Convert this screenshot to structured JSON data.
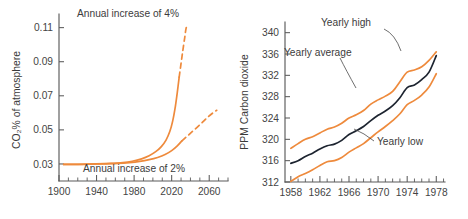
{
  "figure": {
    "background": "#ffffff",
    "orange": "#ee8A3c",
    "navy": "#1d2430",
    "axis_color": "#5a5a5a"
  },
  "left_chart": {
    "ylabel": "CO₂% of atmosphere",
    "y_ticks": [
      "0.03",
      "0.05",
      "0.07",
      "0.09",
      "0.11"
    ],
    "x_ticks": [
      "1900",
      "1940",
      "1980",
      "2020",
      "2060"
    ],
    "annotation_top": "Annual increase of 4%",
    "annotation_bottom": "Annual increase of 2%"
  },
  "right_chart": {
    "ylabel": "PPM Carbon dioxide",
    "y_ticks": [
      "312",
      "316",
      "320",
      "324",
      "328",
      "332",
      "336",
      "340"
    ],
    "x_ticks": [
      "1958",
      "1962",
      "1966",
      "1970",
      "1974",
      "1978"
    ],
    "label_high": "Yearly high",
    "label_average": "Yearly average",
    "label_low": "Yearly low"
  },
  "chart_data": [
    {
      "type": "line",
      "id": "co2-projection",
      "title": "",
      "xlabel": "",
      "ylabel": "CO2% of atmosphere",
      "xlim": [
        1900,
        2080
      ],
      "ylim": [
        0.02,
        0.118
      ],
      "grid": false,
      "legend": "annotations-inline",
      "x_ticks": [
        1900,
        1940,
        1980,
        2020,
        2060
      ],
      "y_ticks": [
        0.03,
        0.05,
        0.07,
        0.09,
        0.11
      ],
      "annotations": [
        {
          "text": "Annual increase of 4%",
          "x": 1985,
          "y": 0.115
        },
        {
          "text": "Annual increase of 2%",
          "x": 1990,
          "y": 0.0245
        }
      ],
      "series": [
        {
          "name": "Annual increase of 4%",
          "color": "#ee8a3c",
          "solid_x": [
            1905,
            1920,
            1940,
            1955,
            1968,
            1978,
            1988,
            1996,
            2003,
            2009,
            2014,
            2018,
            2021,
            2024,
            2026,
            2028
          ],
          "solid_y": [
            0.0297,
            0.0298,
            0.03,
            0.0303,
            0.0308,
            0.0316,
            0.033,
            0.0348,
            0.0372,
            0.0402,
            0.044,
            0.049,
            0.055,
            0.064,
            0.072,
            0.081
          ],
          "dashed_x": [
            2028,
            2030,
            2032,
            2034,
            2035,
            2036
          ],
          "dashed_y": [
            0.081,
            0.089,
            0.097,
            0.1045,
            0.1085,
            0.111
          ]
        },
        {
          "name": "Annual increase of 2%",
          "color": "#ee8a3c",
          "solid_x": [
            1905,
            1925,
            1945,
            1962,
            1975,
            1986,
            1996,
            2005,
            2013,
            2020,
            2026,
            2031
          ],
          "solid_y": [
            0.0297,
            0.0298,
            0.03,
            0.0303,
            0.0308,
            0.0315,
            0.0325,
            0.0338,
            0.0355,
            0.0378,
            0.0406,
            0.0436
          ],
          "dashed_x": [
            2031,
            2038,
            2045,
            2052,
            2058,
            2064,
            2068
          ],
          "dashed_y": [
            0.0436,
            0.047,
            0.0505,
            0.054,
            0.0572,
            0.06,
            0.0615
          ]
        }
      ]
    },
    {
      "type": "line",
      "id": "keeling-curve",
      "title": "",
      "xlabel": "",
      "ylabel": "PPM Carbon dioxide",
      "xlim": [
        1957.2,
        1979.2
      ],
      "ylim": [
        312,
        342
      ],
      "grid": false,
      "legend": "annotations-inline",
      "x_ticks": [
        1958,
        1962,
        1966,
        1970,
        1974,
        1978
      ],
      "x_minor_step": 1,
      "y_ticks": [
        312,
        316,
        320,
        324,
        328,
        332,
        336,
        340
      ],
      "annotations": [
        {
          "text": "Yearly high",
          "x": 1965.6,
          "y": 340.2
        },
        {
          "text": "Yearly average",
          "x": 1962.4,
          "y": 332.2
        },
        {
          "text": "Yearly low",
          "x": 1972.9,
          "y": 316.3
        }
      ],
      "x": [
        1958,
        1959,
        1960,
        1961,
        1962,
        1963,
        1964,
        1965,
        1966,
        1967,
        1968,
        1969,
        1970,
        1971,
        1972,
        1973,
        1974,
        1975,
        1976,
        1977,
        1978
      ],
      "series": [
        {
          "name": "Yearly high",
          "color": "#ee8a3c",
          "values": [
            318.3,
            319.2,
            320.0,
            320.5,
            321.2,
            321.9,
            322.3,
            323.0,
            324.0,
            324.6,
            325.4,
            326.6,
            327.4,
            328.1,
            329.0,
            330.8,
            332.6,
            333.0,
            333.6,
            334.8,
            336.4
          ]
        },
        {
          "name": "Yearly average",
          "color": "#1d2430",
          "values": [
            315.5,
            316.0,
            316.8,
            317.4,
            318.2,
            318.8,
            319.1,
            319.8,
            320.9,
            321.6,
            322.4,
            323.5,
            324.5,
            325.3,
            326.3,
            327.8,
            329.7,
            330.2,
            331.2,
            332.6,
            335.7
          ]
        },
        {
          "name": "Yearly low",
          "color": "#ee8a3c",
          "values": [
            312.1,
            313.0,
            313.6,
            314.3,
            315.1,
            315.8,
            316.0,
            316.6,
            317.6,
            318.4,
            319.2,
            320.3,
            321.4,
            322.4,
            323.5,
            324.8,
            326.5,
            327.3,
            328.3,
            329.8,
            332.3
          ]
        }
      ]
    }
  ]
}
